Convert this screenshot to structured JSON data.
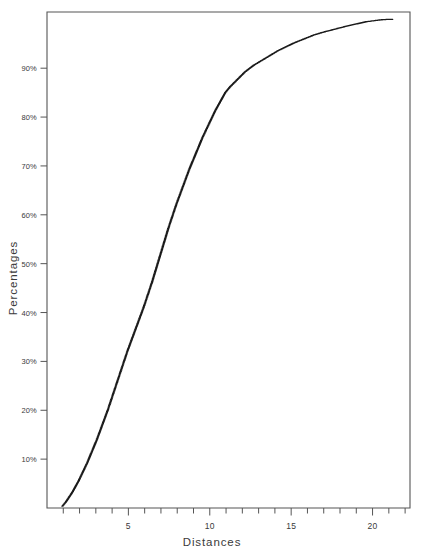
{
  "chart_data": {
    "type": "scatter",
    "title": "",
    "subtitle": "",
    "xlabel": "Distances",
    "ylabel": "Percentages",
    "xlim": [
      0,
      22.3
    ],
    "ylim": [
      0,
      101.5
    ],
    "grid": false,
    "legend": null,
    "legend_position": "none",
    "marker": "dot",
    "marker_size_px": 1.3,
    "series_color": "#1a1a1a",
    "frame_color": "#555555",
    "x_ticks_major": [
      5,
      10,
      15,
      20
    ],
    "x_tick_labels": [
      "5",
      "10",
      "15",
      "20"
    ],
    "x_ticks_minor": [
      1,
      2,
      3,
      4,
      5,
      6,
      7,
      8,
      9,
      10,
      11,
      12,
      13,
      14,
      15,
      16,
      17,
      18,
      19,
      20,
      21,
      22
    ],
    "y_ticks_major": [
      10,
      20,
      30,
      40,
      50,
      60,
      70,
      80,
      90
    ],
    "y_tick_labels": [
      "10%",
      "20%",
      "30%",
      "40%",
      "50%",
      "60%",
      "70%",
      "80%",
      "90%"
    ],
    "series": [
      {
        "name": "Cumulative percentage",
        "x": [
          0.95,
          1.05,
          1.15,
          1.25,
          1.35,
          1.45,
          1.55,
          1.65,
          1.75,
          1.85,
          1.95,
          2.05,
          2.15,
          2.25,
          2.35,
          2.45,
          2.55,
          2.65,
          2.75,
          2.85,
          2.95,
          3.05,
          3.15,
          3.25,
          3.35,
          3.45,
          3.55,
          3.65,
          3.75,
          3.85,
          3.95,
          4.05,
          4.15,
          4.25,
          4.35,
          4.45,
          4.55,
          4.65,
          4.75,
          4.85,
          4.95,
          5.05,
          5.15,
          5.25,
          5.35,
          5.45,
          5.55,
          5.65,
          5.75,
          5.85,
          5.95,
          6.05,
          6.15,
          6.25,
          6.35,
          6.45,
          6.55,
          6.65,
          6.75,
          6.85,
          6.95,
          7.05,
          7.15,
          7.25,
          7.35,
          7.45,
          7.55,
          7.65,
          7.75,
          7.85,
          7.95,
          8.05,
          8.15,
          8.25,
          8.35,
          8.45,
          8.55,
          8.65,
          8.75,
          8.85,
          8.95,
          9.05,
          9.15,
          9.25,
          9.35,
          9.45,
          9.55,
          9.65,
          9.75,
          9.85,
          9.95,
          10.05,
          10.15,
          10.25,
          10.35,
          10.45,
          10.55,
          10.65,
          10.75,
          10.85,
          10.95,
          11.1,
          11.25,
          11.4,
          11.55,
          11.7,
          11.85,
          12.0,
          12.15,
          12.3,
          12.5,
          12.7,
          12.9,
          13.1,
          13.3,
          13.5,
          13.7,
          13.95,
          14.2,
          14.45,
          14.7,
          14.95,
          15.2,
          15.5,
          15.8,
          16.1,
          16.4,
          16.7,
          17.0,
          17.35,
          17.7,
          18.05,
          18.4,
          18.8,
          19.2,
          19.6,
          20.05,
          20.5,
          21.0,
          21.2
        ],
        "y": [
          0.4,
          0.8,
          1.2,
          1.7,
          2.2,
          2.7,
          3.2,
          3.8,
          4.4,
          5.0,
          5.6,
          6.3,
          7.0,
          7.7,
          8.4,
          9.1,
          9.9,
          10.7,
          11.5,
          12.3,
          13.1,
          13.9,
          14.8,
          15.7,
          16.6,
          17.5,
          18.4,
          19.3,
          20.2,
          21.2,
          22.2,
          23.2,
          24.2,
          25.2,
          26.2,
          27.2,
          28.2,
          29.2,
          30.2,
          31.2,
          32.2,
          33.1,
          34.0,
          34.9,
          35.8,
          36.7,
          37.6,
          38.5,
          39.4,
          40.3,
          41.2,
          42.2,
          43.2,
          44.2,
          45.2,
          46.2,
          47.3,
          48.4,
          49.5,
          50.6,
          51.7,
          52.8,
          53.9,
          55.0,
          56.1,
          57.2,
          58.2,
          59.2,
          60.2,
          61.2,
          62.2,
          63.1,
          64.0,
          64.9,
          65.8,
          66.7,
          67.6,
          68.5,
          69.4,
          70.2,
          71.0,
          71.8,
          72.6,
          73.4,
          74.2,
          75.0,
          75.8,
          76.5,
          77.2,
          77.9,
          78.6,
          79.3,
          80.0,
          80.7,
          81.4,
          82.0,
          82.6,
          83.2,
          83.8,
          84.4,
          85.0,
          85.6,
          86.2,
          86.7,
          87.2,
          87.7,
          88.2,
          88.7,
          89.2,
          89.6,
          90.1,
          90.6,
          91.0,
          91.4,
          91.8,
          92.2,
          92.6,
          93.1,
          93.6,
          94.0,
          94.4,
          94.8,
          95.2,
          95.6,
          96.0,
          96.4,
          96.8,
          97.1,
          97.4,
          97.7,
          98.0,
          98.3,
          98.6,
          98.9,
          99.2,
          99.5,
          99.7,
          99.9,
          100.0,
          100.0
        ]
      }
    ]
  },
  "axes": {
    "xlabel": "Distances",
    "ylabel": "Percentages"
  }
}
